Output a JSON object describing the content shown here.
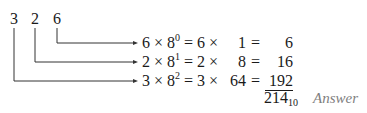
{
  "digits": [
    "3",
    "2",
    "6"
  ],
  "rows": [
    {
      "digit": "6",
      "base": "8",
      "power": "0",
      "times": "6 ×",
      "place_value": "1",
      "result": "6"
    },
    {
      "digit": "2",
      "base": "8",
      "power": "1",
      "times": "2 ×",
      "place_value": "8",
      "result": "16"
    },
    {
      "digit": "3",
      "base": "8",
      "power": "2",
      "times": "3 ×",
      "place_value": "64",
      "result": "192"
    }
  ],
  "total": {
    "value": "214",
    "base": "10"
  },
  "answer_label": "Answer",
  "colors": {
    "text": "#1a1a1a",
    "lines": "#333333",
    "answer": "#808080"
  }
}
